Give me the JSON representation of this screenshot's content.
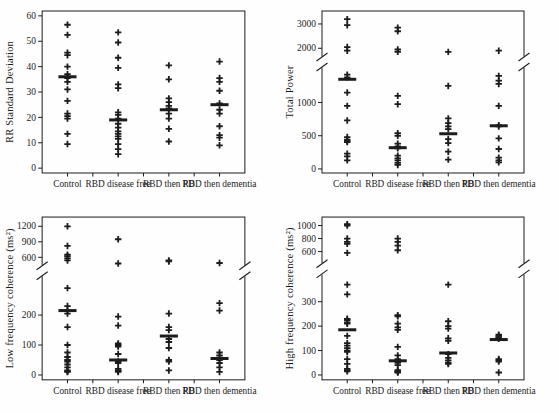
{
  "figure": {
    "background": "#fefefe",
    "ink_color": "#1c1c1c",
    "marker_glyph": "plus-cross",
    "mean_marker": "horizontal-bar"
  },
  "chart_data": [
    {
      "type": "scatter",
      "panel": "top-left",
      "title": "",
      "ylabel": "RR Standard Deviation",
      "xlabel": "",
      "categories": [
        "Control",
        "RBD disease free",
        "RBD then PD",
        "RBD then dementia"
      ],
      "yticks": [
        0,
        10,
        20,
        30,
        40,
        50,
        60
      ],
      "scale": {
        "segments": [
          {
            "domain": [
              0,
              60
            ],
            "range": [
              0.97,
              0.03
            ]
          }
        ],
        "break_frac": null
      },
      "groups": [
        {
          "category": "Control",
          "points": [
            56.5,
            52.5,
            45.5,
            44.5,
            40,
            37,
            35.5,
            34,
            31,
            26.5,
            21.5,
            20.5,
            19.5,
            13.5,
            9.5
          ],
          "mean": 36
        },
        {
          "category": "RBD disease free",
          "points": [
            53.5,
            49.5,
            43.5,
            39.5,
            33,
            31.5,
            22,
            21,
            19.5,
            17.5,
            16,
            14.5,
            13.5,
            12.5,
            11.5,
            9.5,
            7.5,
            5.5
          ],
          "mean": 19
        },
        {
          "category": "RBD then PD",
          "points": [
            40.5,
            35,
            27.5,
            26,
            24.5,
            23.5,
            21.5,
            19.5,
            15.5,
            10.5
          ],
          "mean": 23
        },
        {
          "category": "RBD then dementia",
          "points": [
            42,
            35.5,
            34,
            30.5,
            25.5,
            23,
            21.5,
            16.5,
            13,
            12,
            9
          ],
          "mean": 25
        }
      ]
    },
    {
      "type": "scatter",
      "panel": "top-right",
      "title": "",
      "ylabel": "Total Power",
      "xlabel": "",
      "categories": [
        "Control",
        "RBD disease free",
        "RBD then PD",
        "RBD then dementia"
      ],
      "yticks": [
        0,
        500,
        1000,
        2000,
        3000
      ],
      "scale": {
        "segments": [
          {
            "domain": [
              0,
              1500
            ],
            "range": [
              0.975,
              0.36
            ]
          },
          {
            "domain": [
              1800,
              3400
            ],
            "range": [
              0.26,
              0.02
            ]
          }
        ],
        "break_frac": 0.315
      },
      "groups": [
        {
          "category": "Control",
          "points": [
            3200,
            2950,
            2050,
            1900,
            1420,
            1380,
            1150,
            950,
            730,
            480,
            440,
            420,
            405,
            230,
            190,
            130
          ],
          "mean": 1350
        },
        {
          "category": "RBD disease free",
          "points": [
            2850,
            2700,
            1950,
            1850,
            1100,
            975,
            540,
            500,
            380,
            340,
            310,
            200,
            160,
            130,
            90,
            60
          ],
          "mean": 320
        },
        {
          "category": "RBD then PD",
          "points": [
            1850,
            1250,
            760,
            690,
            640,
            600,
            450,
            390,
            260,
            140
          ],
          "mean": 530
        },
        {
          "category": "RBD then dementia",
          "points": [
            1900,
            1400,
            1330,
            1280,
            950,
            660,
            640,
            460,
            300,
            170,
            130,
            100
          ],
          "mean": 650
        }
      ]
    },
    {
      "type": "scatter",
      "panel": "bottom-left",
      "title": "",
      "ylabel": "Low frequency coherence (ms²)",
      "xlabel": "",
      "categories": [
        "Control",
        "RBD disease free",
        "RBD then PD",
        "RBD then dementia"
      ],
      "yticks": [
        0,
        100,
        200,
        600,
        900,
        1200
      ],
      "scale": {
        "segments": [
          {
            "domain": [
              0,
              330
            ],
            "range": [
              0.97,
              0.363
            ]
          },
          {
            "domain": [
              450,
              1300
            ],
            "range": [
              0.295,
              0.025
            ]
          }
        ],
        "break_frac": 0.33
      },
      "groups": [
        {
          "category": "Control",
          "points": [
            1200,
            820,
            650,
            620,
            580,
            540,
            290,
            230,
            215,
            205,
            160,
            100,
            75,
            60,
            50,
            45,
            35,
            25,
            15,
            12,
            10
          ],
          "mean": 215
        },
        {
          "category": "RBD disease free",
          "points": [
            950,
            480,
            195,
            165,
            105,
            100,
            95,
            70,
            45,
            40,
            20,
            15,
            13,
            10
          ],
          "mean": 50
        },
        {
          "category": "RBD then PD",
          "points": [
            540,
            520,
            205,
            160,
            150,
            120,
            110,
            90,
            50,
            45,
            15
          ],
          "mean": 130
        },
        {
          "category": "RBD then dementia",
          "points": [
            490,
            240,
            215,
            75,
            65,
            50,
            40,
            25,
            10
          ],
          "mean": 55
        }
      ]
    },
    {
      "type": "scatter",
      "panel": "bottom-right",
      "title": "",
      "ylabel": "High frequency coherence (ms²)",
      "xlabel": "",
      "categories": [
        "Control",
        "RBD disease free",
        "RBD then PD",
        "RBD then dementia"
      ],
      "yticks": [
        0,
        100,
        200,
        300,
        600,
        800,
        1000
      ],
      "scale": {
        "segments": [
          {
            "domain": [
              0,
              400
            ],
            "range": [
              0.97,
              0.37
            ]
          },
          {
            "domain": [
              480,
              1080
            ],
            "range": [
              0.26,
              0.02
            ]
          }
        ],
        "break_frac": 0.318
      },
      "groups": [
        {
          "category": "Control",
          "points": [
            1020,
            1000,
            800,
            750,
            720,
            580,
            370,
            330,
            230,
            225,
            215,
            210,
            160,
            130,
            120,
            110,
            100,
            95,
            65,
            45,
            25,
            20,
            15
          ],
          "mean": 185
        },
        {
          "category": "RBD disease free",
          "points": [
            800,
            750,
            690,
            620,
            245,
            240,
            210,
            195,
            185,
            115,
            80,
            65,
            50,
            40,
            20,
            15,
            12,
            10
          ],
          "mean": 58
        },
        {
          "category": "RBD then PD",
          "points": [
            370,
            220,
            200,
            190,
            150,
            140,
            85,
            70,
            60,
            50,
            45
          ],
          "mean": 90
        },
        {
          "category": "RBD then dementia",
          "points": [
            165,
            160,
            155,
            152,
            148,
            65,
            60,
            55,
            10
          ],
          "mean": 145
        }
      ]
    }
  ]
}
